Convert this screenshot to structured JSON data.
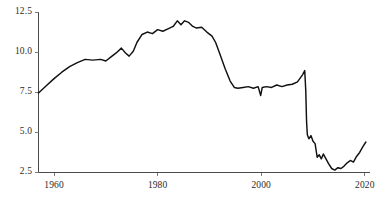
{
  "chart_data": {
    "type": "line",
    "title": "",
    "xlabel": "",
    "ylabel": "",
    "xlim": [
      1957,
      2021
    ],
    "ylim": [
      2.5,
      12.5
    ],
    "grid": false,
    "legend": null,
    "series": [
      {
        "name": "series-1",
        "x": [
          1957.0,
          1958.5,
          1960.0,
          1961.5,
          1963.0,
          1964.5,
          1966.0,
          1967.5,
          1969.0,
          1970.0,
          1971.0,
          1972.0,
          1973.0,
          1973.8,
          1974.5,
          1975.3,
          1976.0,
          1977.0,
          1978.0,
          1979.0,
          1980.0,
          1981.0,
          1982.0,
          1983.0,
          1983.8,
          1984.5,
          1985.2,
          1986.0,
          1986.8,
          1987.5,
          1988.5,
          1989.5,
          1990.5,
          1991.2,
          1992.0,
          1993.0,
          1994.0,
          1994.8,
          1995.5,
          1996.5,
          1997.5,
          1998.5,
          1999.4,
          1999.9,
          2000.2,
          2001.0,
          2002.0,
          2003.0,
          2004.0,
          2005.0,
          2006.0,
          2007.0,
          2008.0,
          2008.4,
          2008.6,
          2008.75,
          2008.9,
          2009.2,
          2009.6,
          2010.0,
          2010.4,
          2010.8,
          2011.2,
          2011.6,
          2012.0,
          2012.5,
          2013.0,
          2013.6,
          2014.2,
          2014.8,
          2015.4,
          2016.0,
          2016.6,
          2017.2,
          2017.8,
          2018.4,
          2019.0,
          2019.6,
          2020.2
        ],
        "y": [
          7.45,
          7.9,
          8.35,
          8.75,
          9.1,
          9.35,
          9.55,
          9.5,
          9.55,
          9.45,
          9.7,
          9.95,
          10.25,
          9.95,
          9.75,
          10.05,
          10.6,
          11.1,
          11.25,
          11.15,
          11.4,
          11.3,
          11.45,
          11.6,
          11.95,
          11.7,
          11.95,
          11.85,
          11.6,
          11.5,
          11.55,
          11.25,
          11.0,
          10.6,
          9.9,
          9.0,
          8.2,
          7.8,
          7.75,
          7.8,
          7.85,
          7.75,
          7.85,
          7.3,
          7.8,
          7.85,
          7.8,
          7.95,
          7.85,
          7.95,
          8.0,
          8.15,
          8.6,
          8.85,
          7.6,
          5.7,
          4.85,
          4.6,
          4.8,
          4.45,
          4.3,
          3.45,
          3.6,
          3.35,
          3.65,
          3.35,
          3.05,
          2.75,
          2.65,
          2.8,
          2.75,
          2.9,
          3.1,
          3.25,
          3.15,
          3.5,
          3.75,
          4.1,
          4.4
        ]
      }
    ],
    "yticks": [
      {
        "value": 2.5,
        "label": "2.5"
      },
      {
        "value": 5.0,
        "label": "5.0"
      },
      {
        "value": 7.5,
        "label": "7.5"
      },
      {
        "value": 10.0,
        "label": "10.0"
      },
      {
        "value": 12.5,
        "label": "12.5"
      }
    ],
    "xticks": [
      {
        "value": 1960,
        "label": "1960"
      },
      {
        "value": 1980,
        "label": "1980"
      },
      {
        "value": 2000,
        "label": "2000"
      },
      {
        "value": 2020,
        "label": "2020"
      }
    ]
  }
}
